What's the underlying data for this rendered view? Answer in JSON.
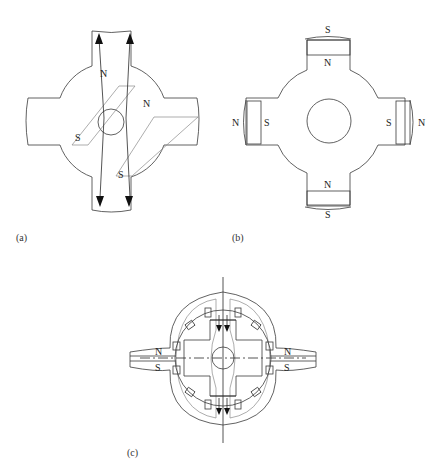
{
  "figure": {
    "panels": [
      {
        "id": "a",
        "caption": "(a)",
        "labels": {
          "n_upper": "N",
          "s_upper": "S",
          "n_right": "N",
          "s_lower": "S"
        }
      },
      {
        "id": "b",
        "caption": "(b)",
        "labels": {
          "top_outer": "S",
          "top_inner": "N",
          "left_outer": "N",
          "left_inner": "S",
          "right_inner": "S",
          "right_outer": "N",
          "bottom_inner": "N",
          "bottom_outer": "S"
        }
      },
      {
        "id": "c",
        "caption": "(c)",
        "labels": {
          "left_n": "N",
          "left_s": "S",
          "right_n": "N",
          "right_s": "S"
        }
      }
    ],
    "colors": {
      "line": "#3a3a3a",
      "light_line": "#8a8a8a",
      "background": "#ffffff"
    }
  }
}
